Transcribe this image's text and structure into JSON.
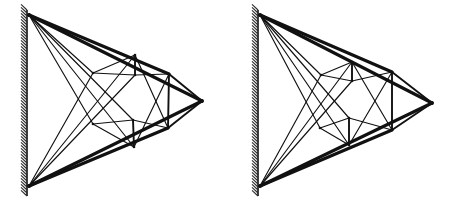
{
  "figure": {
    "background_color": "#ffffff",
    "line_color": "#111111",
    "width": 456,
    "height": 206,
    "panel_count": 2,
    "panel_labels": [
      "",
      ""
    ]
  },
  "chart_data": {
    "type": "diagram",
    "subtitle": "",
    "xlabel": "",
    "ylabel": "",
    "grid": false,
    "legend": [],
    "annotations": [],
    "panels": [
      {
        "name": "left-truss",
        "wall": {
          "x": 27,
          "y_top": 10,
          "y_bottom": 196,
          "hatch_side": "left",
          "hatch_count": 62
        },
        "support_top": {
          "x": 29,
          "y": 15
        },
        "support_bottom": {
          "x": 29,
          "y": 186
        },
        "tip": {
          "x": 202,
          "y": 101
        },
        "nodes": [
          {
            "id": "A",
            "x": 29,
            "y": 15
          },
          {
            "id": "B",
            "x": 29,
            "y": 186
          },
          {
            "id": "C",
            "x": 93,
            "y": 73
          },
          {
            "id": "D",
            "x": 93,
            "y": 124
          },
          {
            "id": "E",
            "x": 135,
            "y": 55
          },
          {
            "id": "F",
            "x": 135,
            "y": 75
          },
          {
            "id": "G",
            "x": 133,
            "y": 120
          },
          {
            "id": "H",
            "x": 134,
            "y": 147
          },
          {
            "id": "I",
            "x": 169,
            "y": 74
          },
          {
            "id": "J",
            "x": 168,
            "y": 128
          },
          {
            "id": "K",
            "x": 202,
            "y": 101
          }
        ],
        "members": [
          {
            "from": "A",
            "to": "K",
            "weight": "heavy"
          },
          {
            "from": "B",
            "to": "K",
            "weight": "heavy"
          },
          {
            "from": "A",
            "to": "I",
            "weight": "heavy"
          },
          {
            "from": "B",
            "to": "J",
            "weight": "heavy"
          },
          {
            "from": "A",
            "to": "C",
            "weight": "light"
          },
          {
            "from": "A",
            "to": "D",
            "weight": "light"
          },
          {
            "from": "A",
            "to": "G",
            "weight": "light"
          },
          {
            "from": "A",
            "to": "H",
            "weight": "light"
          },
          {
            "from": "B",
            "to": "C",
            "weight": "light"
          },
          {
            "from": "B",
            "to": "E",
            "weight": "light"
          },
          {
            "from": "B",
            "to": "F",
            "weight": "light"
          },
          {
            "from": "C",
            "to": "E",
            "weight": "light"
          },
          {
            "from": "C",
            "to": "F",
            "weight": "light"
          },
          {
            "from": "D",
            "to": "G",
            "weight": "light"
          },
          {
            "from": "D",
            "to": "H",
            "weight": "light"
          },
          {
            "from": "E",
            "to": "F",
            "weight": "medium"
          },
          {
            "from": "G",
            "to": "H",
            "weight": "medium"
          },
          {
            "from": "F",
            "to": "I",
            "weight": "light"
          },
          {
            "from": "G",
            "to": "J",
            "weight": "light"
          },
          {
            "from": "E",
            "to": "J",
            "weight": "light"
          },
          {
            "from": "H",
            "to": "I",
            "weight": "light"
          },
          {
            "from": "I",
            "to": "J",
            "weight": "medium"
          },
          {
            "from": "I",
            "to": "K",
            "weight": "medium"
          },
          {
            "from": "J",
            "to": "K",
            "weight": "medium"
          }
        ]
      },
      {
        "name": "right-truss",
        "wall": {
          "x": 258,
          "y_top": 10,
          "y_bottom": 196,
          "hatch_side": "left",
          "hatch_count": 62
        },
        "support_top": {
          "x": 260,
          "y": 15
        },
        "support_bottom": {
          "x": 260,
          "y": 186
        },
        "tip": {
          "x": 432,
          "y": 103
        },
        "nodes": [
          {
            "id": "A",
            "x": 260,
            "y": 15
          },
          {
            "id": "B",
            "x": 260,
            "y": 186
          },
          {
            "id": "C",
            "x": 321,
            "y": 75
          },
          {
            "id": "D",
            "x": 320,
            "y": 128
          },
          {
            "id": "E",
            "x": 352,
            "y": 62
          },
          {
            "id": "F",
            "x": 352,
            "y": 81
          },
          {
            "id": "G",
            "x": 349,
            "y": 118
          },
          {
            "id": "H",
            "x": 349,
            "y": 145
          },
          {
            "id": "I",
            "x": 392,
            "y": 72
          },
          {
            "id": "J",
            "x": 392,
            "y": 130
          },
          {
            "id": "K",
            "x": 432,
            "y": 103
          }
        ],
        "members": [
          {
            "from": "A",
            "to": "K",
            "weight": "heavy"
          },
          {
            "from": "B",
            "to": "K",
            "weight": "heavy"
          },
          {
            "from": "A",
            "to": "I",
            "weight": "heavy"
          },
          {
            "from": "B",
            "to": "J",
            "weight": "heavy"
          },
          {
            "from": "A",
            "to": "C",
            "weight": "light"
          },
          {
            "from": "A",
            "to": "D",
            "weight": "light"
          },
          {
            "from": "A",
            "to": "G",
            "weight": "light"
          },
          {
            "from": "A",
            "to": "H",
            "weight": "light"
          },
          {
            "from": "B",
            "to": "C",
            "weight": "light"
          },
          {
            "from": "B",
            "to": "E",
            "weight": "light"
          },
          {
            "from": "B",
            "to": "F",
            "weight": "light"
          },
          {
            "from": "C",
            "to": "E",
            "weight": "light"
          },
          {
            "from": "C",
            "to": "F",
            "weight": "light"
          },
          {
            "from": "D",
            "to": "G",
            "weight": "light"
          },
          {
            "from": "D",
            "to": "H",
            "weight": "light"
          },
          {
            "from": "E",
            "to": "F",
            "weight": "medium"
          },
          {
            "from": "G",
            "to": "H",
            "weight": "medium"
          },
          {
            "from": "F",
            "to": "I",
            "weight": "light"
          },
          {
            "from": "G",
            "to": "J",
            "weight": "light"
          },
          {
            "from": "E",
            "to": "J",
            "weight": "light"
          },
          {
            "from": "H",
            "to": "I",
            "weight": "light"
          },
          {
            "from": "I",
            "to": "J",
            "weight": "medium"
          },
          {
            "from": "I",
            "to": "K",
            "weight": "medium"
          },
          {
            "from": "J",
            "to": "K",
            "weight": "medium"
          }
        ]
      }
    ],
    "stroke_weights": {
      "light": 1.15,
      "medium": 1.9,
      "heavy": 3.1
    }
  }
}
